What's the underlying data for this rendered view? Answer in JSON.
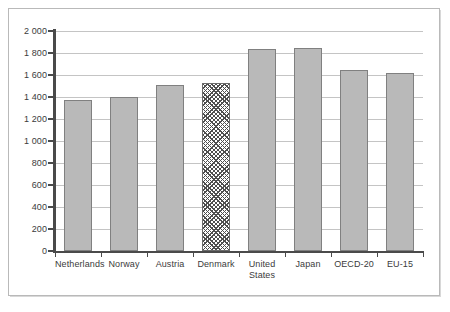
{
  "chart_data": {
    "type": "bar",
    "title": "",
    "subtitle": "",
    "xlabel": "",
    "ylabel": "",
    "categories": [
      "Netherlands",
      "Norway",
      "Austria",
      "Denmark",
      "United States",
      "Japan",
      "OECD-20",
      "EU-15"
    ],
    "values": [
      1370,
      1400,
      1510,
      1525,
      1835,
      1845,
      1645,
      1615
    ],
    "highlight_category": "Denmark",
    "highlight_style": "diagonal-cross-hatch",
    "ylim": [
      0,
      2000
    ],
    "ytick_step": 200,
    "ytick_labels": [
      "0",
      "200",
      "400",
      "600",
      "800",
      "1 000",
      "1 200",
      "1 400",
      "1 600",
      "1 800",
      "2 000"
    ],
    "ytick_values": [
      0,
      200,
      400,
      600,
      800,
      1000,
      1200,
      1400,
      1600,
      1800,
      2000
    ],
    "grid": "horizontal",
    "legend": "none",
    "colors": {
      "bar_fill": "#b9b9b9",
      "bar_stroke": "#808080",
      "highlight_stroke": "#6b6b6b",
      "gridline": "#c4c4c4",
      "axis": "#4a4a4a",
      "text": "#3b3b3b",
      "frame": "#b9b9b9",
      "background": "#ffffff"
    }
  }
}
